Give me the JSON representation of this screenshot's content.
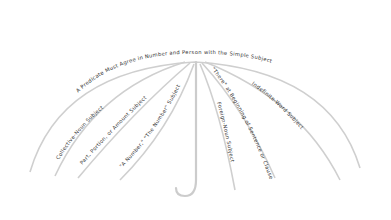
{
  "diagram": {
    "title": "A Predicate Must Agree in Number and Person with the Simple Subject",
    "ribs": [
      {
        "id": "collective-noun",
        "label": "Collective-Noun Subject"
      },
      {
        "id": "part-portion",
        "label": "Part, Portion, or Amount Subject"
      },
      {
        "id": "a-number",
        "label": "\"A Number,\" \"The Number\" Subject"
      },
      {
        "id": "foreign-noun",
        "label": "Foreign-Noun Subject"
      },
      {
        "id": "there",
        "label": "\"There\" at Beginning of Sentence or Clause"
      },
      {
        "id": "indefinite-word",
        "label": "Indefinite-Word Subject"
      }
    ]
  }
}
